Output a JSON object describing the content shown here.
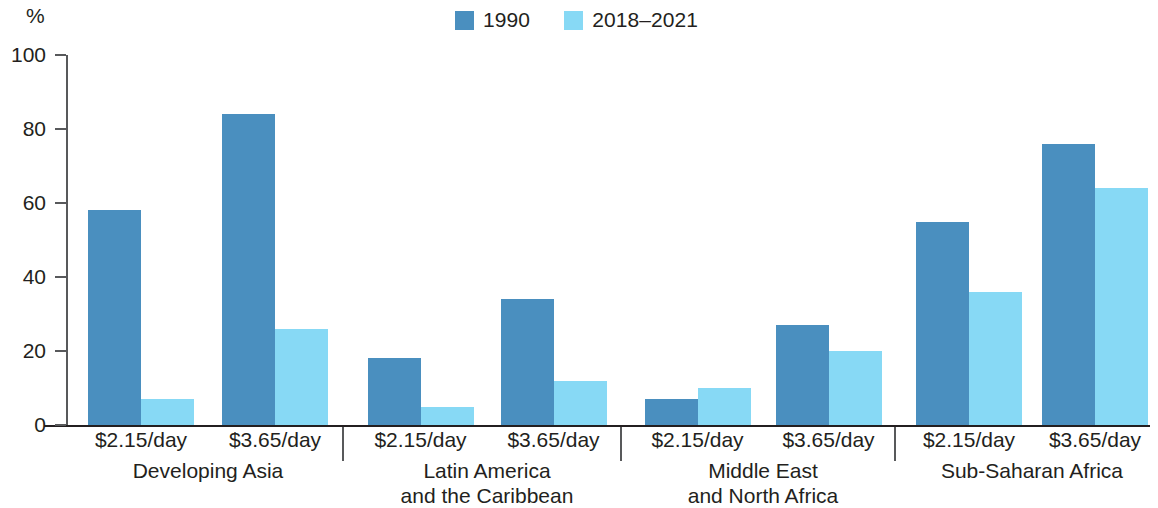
{
  "axis": {
    "unit": "%",
    "yticks": [
      0,
      20,
      40,
      60,
      80,
      100
    ],
    "ymin": 0,
    "ymax": 100
  },
  "legend": {
    "items": [
      {
        "label": "1990",
        "color": "#4a8fbf"
      },
      {
        "label": "2018–2021",
        "color": "#87d9f5"
      }
    ]
  },
  "colors": {
    "series_1990": "#4a8fbf",
    "series_2018_2021": "#87d9f5",
    "axis": "#58595b",
    "text": "#231f20",
    "background": "#ffffff"
  },
  "chart_data": {
    "type": "bar",
    "title": "",
    "xlabel": "",
    "ylabel": "%",
    "ylim": [
      0,
      100
    ],
    "grid": false,
    "legend_position": "top-center",
    "categories": [
      "Developing Asia – $2.15/day",
      "Developing Asia – $3.65/day",
      "Latin America and the Caribbean – $2.15/day",
      "Latin America and the Caribbean – $3.65/day",
      "Middle East and North Africa – $2.15/day",
      "Middle East and North Africa – $3.65/day",
      "Sub-Saharan Africa – $2.15/day",
      "Sub-Saharan Africa – $3.65/day"
    ],
    "series": [
      {
        "name": "1990",
        "values": [
          58,
          84,
          18,
          34,
          7,
          27,
          55,
          76
        ]
      },
      {
        "name": "2018–2021",
        "values": [
          7,
          26,
          5,
          12,
          10,
          20,
          36,
          64
        ]
      }
    ]
  },
  "groups": [
    {
      "name": "Developing Asia",
      "line1": "Developing  Asia",
      "line2": "",
      "pairs": [
        {
          "label": "$2.15/day",
          "v1990": 58,
          "v2018": 7
        },
        {
          "label": "$3.65/day",
          "v1990": 84,
          "v2018": 26
        }
      ]
    },
    {
      "name": "Latin America and the Caribbean",
      "line1": "Latin America",
      "line2": "and the Caribbean",
      "pairs": [
        {
          "label": "$2.15/day",
          "v1990": 18,
          "v2018": 5
        },
        {
          "label": "$3.65/day",
          "v1990": 34,
          "v2018": 12
        }
      ]
    },
    {
      "name": "Middle East and North Africa",
      "line1": "Middle East",
      "line2": "and North Africa",
      "pairs": [
        {
          "label": "$2.15/day",
          "v1990": 7,
          "v2018": 10
        },
        {
          "label": "$3.65/day",
          "v1990": 27,
          "v2018": 20
        }
      ]
    },
    {
      "name": "Sub-Saharan Africa",
      "line1": "Sub-Saharan Africa",
      "line2": "",
      "pairs": [
        {
          "label": "$2.15/day",
          "v1990": 55,
          "v2018": 36
        },
        {
          "label": "$3.65/day",
          "v1990": 76,
          "v2018": 64
        }
      ]
    }
  ]
}
